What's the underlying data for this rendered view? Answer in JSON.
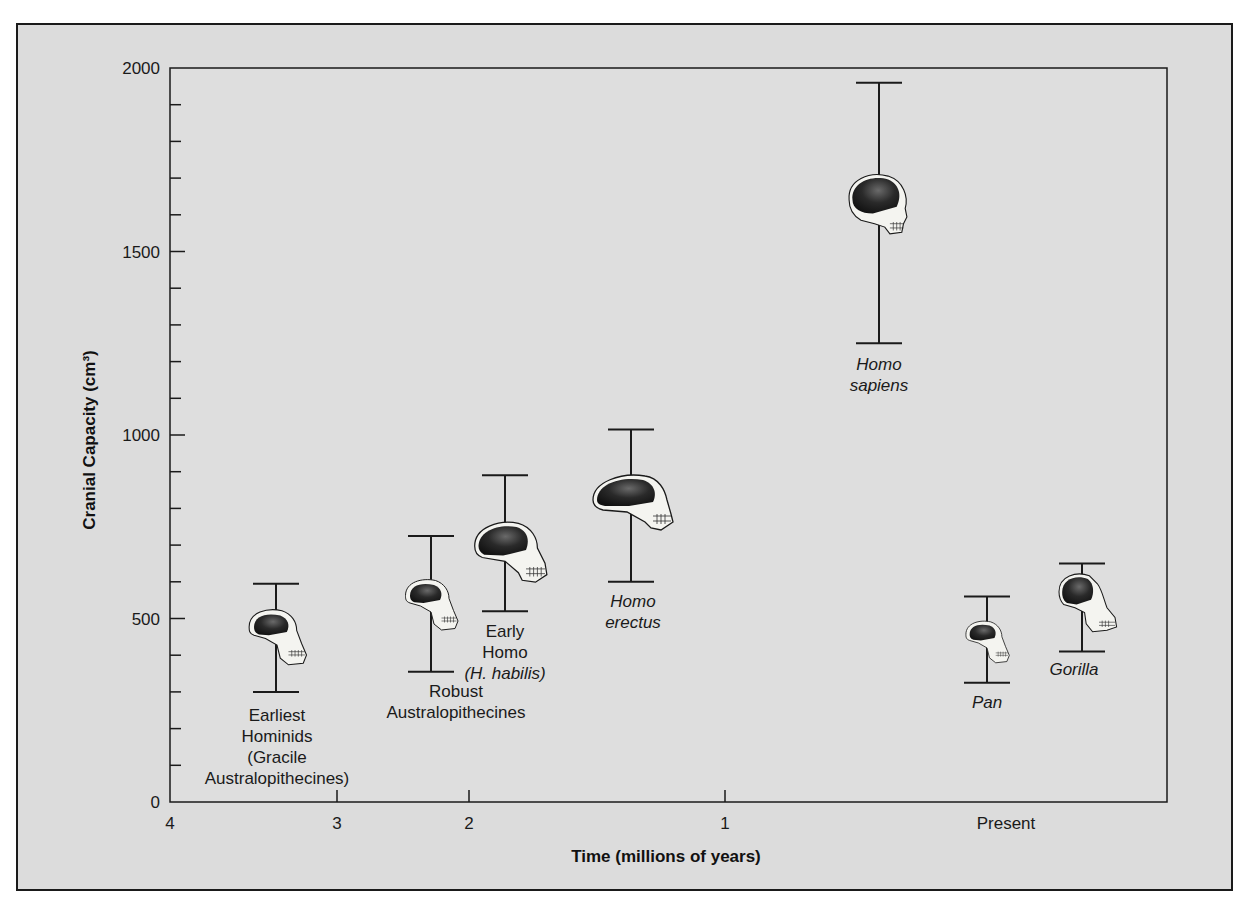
{
  "chart_data": {
    "type": "range",
    "title": "",
    "xlabel": "Time (millions of years)",
    "ylabel": "Cranial Capacity (cm³)",
    "ylim": [
      0,
      2000
    ],
    "y_ticks_major": [
      0,
      500,
      1000,
      1500,
      2000
    ],
    "y_minor_step": 100,
    "x_ticks": [
      "4",
      "3",
      "2",
      "1",
      "Present"
    ],
    "grid": false,
    "legend": null,
    "series": [
      {
        "name": "Earliest Hominids (Gracile Australopithecines)",
        "label_lines": [
          "Earliest",
          "Hominids",
          "(Gracile",
          "Australopithecines)"
        ],
        "italic": false,
        "time_mya": 3.4,
        "min": 300,
        "max": 595,
        "icon": "australopithecine-skull-icon"
      },
      {
        "name": "Robust Australopithecines",
        "label_lines": [
          "Robust",
          "Australopithecines"
        ],
        "italic": false,
        "time_mya": 2.3,
        "min": 355,
        "max": 725,
        "icon": "robust-australopithecine-skull-icon"
      },
      {
        "name": "Early Homo (H. habilis)",
        "label_lines": [
          "Early",
          "Homo",
          "(H. habilis)"
        ],
        "italic": false,
        "italic_line": 2,
        "time_mya": 1.85,
        "min": 520,
        "max": 890,
        "icon": "habilis-skull-icon"
      },
      {
        "name": "Homo erectus",
        "label_lines": [
          "Homo",
          "erectus"
        ],
        "italic": true,
        "time_mya": 1.4,
        "min": 600,
        "max": 1015,
        "icon": "erectus-skull-icon"
      },
      {
        "name": "Homo sapiens",
        "label_lines": [
          "Homo",
          "sapiens"
        ],
        "italic": true,
        "time_mya": 0.4,
        "min": 1250,
        "max": 1960,
        "icon": "sapiens-skull-icon"
      },
      {
        "name": "Pan",
        "label_lines": [
          "Pan"
        ],
        "italic": true,
        "time_mya": 0,
        "min": 325,
        "max": 560,
        "icon": "chimpanzee-skull-icon"
      },
      {
        "name": "Gorilla",
        "label_lines": [
          "Gorilla"
        ],
        "italic": true,
        "time_mya": 0,
        "min": 410,
        "max": 650,
        "icon": "gorilla-skull-icon"
      }
    ]
  },
  "colors": {
    "background": "#dcdcdc",
    "axis": "#1a1a1a",
    "skull_fill": "#f4f4f0",
    "braincase": "#1e1e1e"
  }
}
